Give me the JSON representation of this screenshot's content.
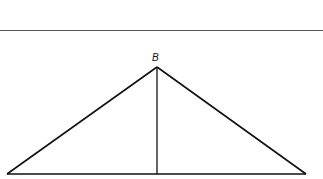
{
  "diagram": {
    "type": "geometry-triangle",
    "labels": {
      "apex": "B"
    },
    "points": {
      "B": [
        157,
        67
      ],
      "left_base": [
        7,
        174
      ],
      "right_base": [
        306,
        174
      ],
      "foot": [
        157,
        174
      ]
    },
    "stroke_color": "#111111",
    "rule_color": "#555555"
  }
}
